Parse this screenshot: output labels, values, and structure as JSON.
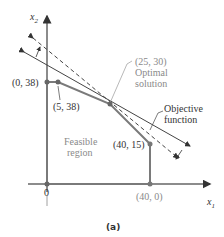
{
  "axes": {
    "y_label": "x",
    "y_sub": "2",
    "x_label": "x",
    "x_sub": "1",
    "origin_label": "0"
  },
  "points": {
    "p0_38": "(0, 38)",
    "p5_38": "(5, 38)",
    "p25_30": "(25, 30)",
    "p40_15": "(40, 15)",
    "p40_0": "(40, 0)"
  },
  "annotations": {
    "optimal_line1": "Optimal",
    "optimal_line2": "solution",
    "objective_line1": "Objective",
    "objective_line2": "function",
    "feasible_line1": "Feasible",
    "feasible_line2": "region"
  },
  "caption": "(a)",
  "colors": {
    "axis": "#555555",
    "region_edge": "#777777",
    "objective_line": "#444444",
    "label_gray": "#8a8a8a"
  }
}
